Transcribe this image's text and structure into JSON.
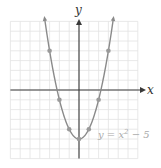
{
  "chart_data": {
    "type": "line",
    "title": "",
    "xlabel": "x",
    "ylabel": "y",
    "equation_label": "y = x² − 5",
    "equation": {
      "base": "y = x",
      "exp": "2",
      "tail": " − 5"
    },
    "xlim": [
      -7,
      6
    ],
    "ylim": [
      -7,
      7
    ],
    "grid": true,
    "function": "x^2 - 5",
    "curve_x_range": [
      -3.5,
      3.5
    ],
    "points": [
      {
        "x": -3,
        "y": 4
      },
      {
        "x": -2,
        "y": -1
      },
      {
        "x": -1,
        "y": -4
      },
      {
        "x": 0,
        "y": -5
      },
      {
        "x": 1,
        "y": -4
      },
      {
        "x": 2,
        "y": -1
      },
      {
        "x": 3,
        "y": 4
      }
    ],
    "colors": {
      "grid": "#e2e2e2",
      "axes": "#3a3a3a",
      "curve": "#8a8a8a",
      "points": "#9a9a9a",
      "label": "#aaaaaa"
    }
  }
}
